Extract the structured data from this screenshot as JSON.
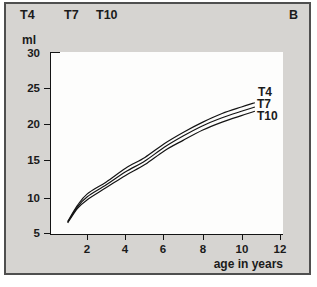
{
  "figure": {
    "panel_label": "B",
    "header_curve_names": [
      "T4",
      "T7",
      "T10"
    ],
    "y_unit_label": "ml",
    "x_axis_label": "age in years",
    "y_tick_labels": [
      "30",
      "25",
      "20",
      "15",
      "10",
      "5"
    ],
    "x_tick_labels": [
      "2",
      "4",
      "6",
      "8",
      "10",
      "12"
    ],
    "curve_end_labels": [
      "T4",
      "T7",
      "T10"
    ],
    "colors": {
      "panel_bg": "#d6d4d1",
      "plot_bg": "#fdfdfc",
      "line": "#141414",
      "text": "#1b1b1b",
      "frame": "#4f4f4f"
    }
  },
  "chart_data": {
    "type": "line",
    "title": "",
    "xlabel": "age in years",
    "ylabel": "ml",
    "xlim": [
      0.1,
      12.2
    ],
    "ylim": [
      4.7,
      30
    ],
    "x_ticks": [
      2,
      4,
      6,
      8,
      10,
      12
    ],
    "y_ticks": [
      5,
      10,
      15,
      20,
      25,
      30
    ],
    "grid": false,
    "legend_position": "top-left",
    "panel_annotation": "B",
    "x": [
      1,
      1.5,
      2,
      3,
      4,
      5,
      6,
      7,
      8,
      9,
      10,
      10.7
    ],
    "series": [
      {
        "name": "T4",
        "values": [
          6.6,
          8.8,
          10.4,
          12.1,
          14.0,
          15.5,
          17.4,
          19.0,
          20.4,
          21.6,
          22.5,
          23.1
        ]
      },
      {
        "name": "T7",
        "values": [
          6.5,
          8.6,
          10.0,
          11.7,
          13.5,
          15.0,
          16.9,
          18.5,
          19.9,
          21.0,
          21.9,
          22.5
        ]
      },
      {
        "name": "T10",
        "values": [
          6.4,
          8.4,
          9.6,
          11.3,
          13.0,
          14.5,
          16.4,
          17.9,
          19.3,
          20.4,
          21.3,
          21.9
        ]
      }
    ]
  }
}
